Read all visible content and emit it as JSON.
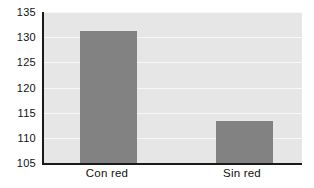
{
  "chart_data": {
    "type": "bar",
    "title": "",
    "subtitle": "",
    "xlabel": "",
    "ylabel": "",
    "categories": [
      "Con red",
      "Sin red"
    ],
    "values": [
      131.2,
      113.3
    ],
    "series": [
      {
        "name": "",
        "values": [
          131.2,
          113.3
        ]
      }
    ],
    "ylim": [
      105,
      135
    ],
    "y_ticks": [
      105,
      110,
      115,
      120,
      125,
      130,
      135
    ],
    "y_tick_labels": [
      "105",
      "110",
      "115",
      "120",
      "125",
      "130",
      "135"
    ],
    "x_ticks": [
      "Con red",
      "Sin red"
    ],
    "grid": true,
    "grid_axis": "y",
    "legend": false,
    "legend_position": "none",
    "annotations": [],
    "colors": {
      "bar": "#828282",
      "plot_background": "#e6e6e6",
      "gridline": "#f7f7f7",
      "axis": "#1a1a1a",
      "text": "#111111",
      "figure_background": "#ffffff"
    }
  }
}
